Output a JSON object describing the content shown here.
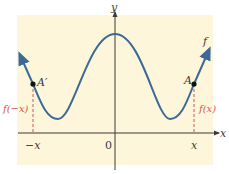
{
  "figure": {
    "axes": {
      "x_label": "x",
      "y_label": "y",
      "origin_label": "0"
    },
    "ticks": {
      "neg_x": "−x",
      "pos_x": "x"
    },
    "points": {
      "left": "A′",
      "right": "A"
    },
    "function_label": "f",
    "value_labels": {
      "left": "f(−x)",
      "right": "f(x)"
    },
    "colors": {
      "background": "#fdf6da",
      "curve": "#3c6a96",
      "axes": "#3a3a3a",
      "dashed_guides": "#d0565a",
      "point": "#111111"
    }
  }
}
